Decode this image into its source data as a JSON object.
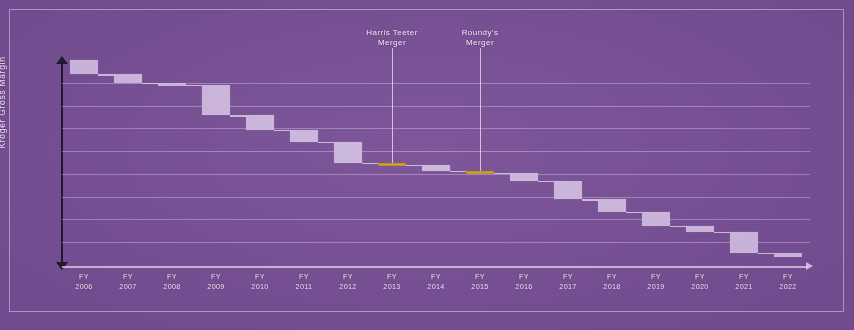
{
  "chart_data": {
    "type": "bar",
    "chart_variant": "waterfall",
    "title": "",
    "xlabel": "",
    "ylabel": "Kroger Gross Margin",
    "grid": true,
    "gridline_count": 8,
    "legend_position": "none",
    "axis_note": "y-axis is an unlabeled double-headed arrow indicating Kroger Gross Margin direction; x-axis is a fiscal-year timeline",
    "categories": [
      "FY 2006",
      "FY 2007",
      "FY 2008",
      "FY 2009",
      "FY 2010",
      "FY 2011",
      "FY 2012",
      "FY 2013",
      "FY 2014",
      "FY 2015",
      "FY 2016",
      "FY 2017",
      "FY 2018",
      "FY 2019",
      "FY 2020",
      "FY 2021",
      "FY 2022"
    ],
    "tick_lines": [
      [
        "FY",
        "2006"
      ],
      [
        "FY",
        "2007"
      ],
      [
        "FY",
        "2008"
      ],
      [
        "FY",
        "2009"
      ],
      [
        "FY",
        "2010"
      ],
      [
        "FY",
        "2011"
      ],
      [
        "FY",
        "2012"
      ],
      [
        "FY",
        "2013"
      ],
      [
        "FY",
        "2014"
      ],
      [
        "FY",
        "2015"
      ],
      [
        "FY",
        "2016"
      ],
      [
        "FY",
        "2017"
      ],
      [
        "FY",
        "2018"
      ],
      [
        "FY",
        "2019"
      ],
      [
        "FY",
        "2020"
      ],
      [
        "FY",
        "2021"
      ],
      [
        "FY",
        "2022"
      ]
    ],
    "cumulative_start": 100,
    "cumulative_end": 8,
    "values": [
      -7,
      -4,
      -1,
      -15,
      -7,
      -6,
      -10,
      -1,
      -3,
      -1,
      -4,
      -9,
      -6,
      -7,
      -3,
      -10,
      -2
    ],
    "cumulative": [
      100,
      93,
      89,
      88,
      73,
      66,
      60,
      50,
      49,
      46,
      45,
      41,
      32,
      26,
      19,
      16,
      6
    ],
    "highlight_indices": [
      7,
      9
    ],
    "highlight_color": "#d8a82a",
    "bar_color": "#cbb6db",
    "background_color": "#7a5296",
    "annotations": [
      {
        "label": "Harris Teeter\nMerger",
        "category": "FY 2013",
        "index": 7
      },
      {
        "label": "Roundy's\nMerger",
        "category": "FY 2015",
        "index": 9
      }
    ]
  },
  "colors": {
    "background": "#7a5296",
    "bar": "#cbb6db",
    "highlight": "#d8a82a",
    "gridline": "#ded2ea",
    "axis": "#241a2c",
    "text": "#f2eaf7"
  }
}
